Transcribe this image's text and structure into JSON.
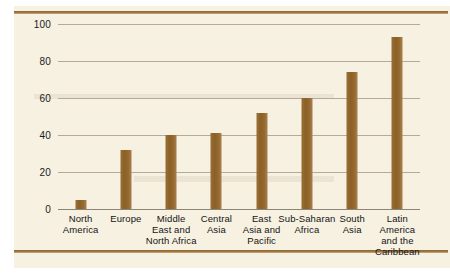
{
  "figure": {
    "background_color": "#f7f1e2",
    "rule_color": "#8a6434",
    "bar_color": "#8b6128",
    "gridline_color": "#b3aa99"
  },
  "chart_data": {
    "type": "bar",
    "title": "",
    "xlabel": "",
    "ylabel": "",
    "ylim": [
      0,
      100
    ],
    "yticks": [
      0,
      20,
      40,
      60,
      80,
      100
    ],
    "grid": true,
    "legend": "none",
    "categories": [
      "North America",
      "Europe",
      "Middle East and North Africa",
      "Central Asia",
      "East Asia and Pacific",
      "Sub-Saharan Africa",
      "South Asia",
      "Latin America and the Caribbean"
    ],
    "category_label_lines": [
      [
        "North",
        "America"
      ],
      [
        "Europe"
      ],
      [
        "Middle",
        "East and",
        "North Africa"
      ],
      [
        "Central",
        "Asia"
      ],
      [
        "East",
        "Asia and",
        "Pacific"
      ],
      [
        "Sub-Saharan",
        "Africa"
      ],
      [
        "South",
        "Asia"
      ],
      [
        "Latin",
        "America",
        "and the",
        "Caribbean"
      ]
    ],
    "values": [
      5,
      32,
      40,
      41,
      52,
      60,
      74,
      93
    ]
  }
}
